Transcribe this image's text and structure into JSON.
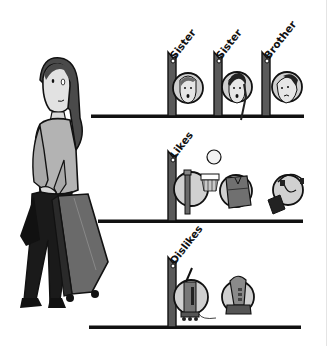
{
  "figure": {
    "palette": {
      "outline": "#111111",
      "post": "#555555",
      "circle": "#d2d2d2",
      "skin": "#e0e0e0",
      "hair": "#4a4a4a",
      "shirt": "#b5b5b5",
      "dark": "#1a1a1a",
      "suitcase": "#6a6a6a",
      "background": "#ffffff"
    }
  },
  "shelves": [
    {
      "id": "family",
      "tags": [
        {
          "label": "Sister",
          "item": "sister-1 face"
        },
        {
          "label": "Sister",
          "item": "sister-2 face"
        },
        {
          "label": "Brother",
          "item": "brother face"
        }
      ]
    },
    {
      "id": "likes",
      "tags": [
        {
          "label": "Likes"
        }
      ],
      "items": [
        "basketball hoop",
        "ball",
        "backpack",
        "headphones"
      ]
    },
    {
      "id": "dislikes",
      "tags": [
        {
          "label": "Dislikes"
        }
      ],
      "items": [
        "vacuum cleaner",
        "hair dryer"
      ]
    }
  ],
  "character": {
    "name": "girl with suitcase"
  }
}
